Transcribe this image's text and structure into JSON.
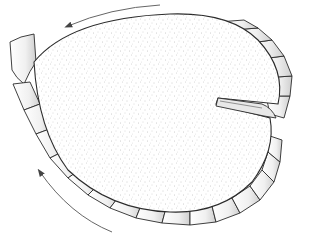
{
  "figure": {
    "colors": {
      "background": "#ffffff",
      "stroke": "#2a2a2a",
      "arrow": "#555555",
      "pleat_fill": "#f2f2f2",
      "pleat_shade": "#cfcfcf",
      "stipple": "#9a9a9a"
    },
    "arrows": [
      {
        "name": "top-arrow",
        "direction": "counterclockwise"
      },
      {
        "name": "bottom-left-arrow",
        "direction": "counterclockwise"
      }
    ]
  }
}
